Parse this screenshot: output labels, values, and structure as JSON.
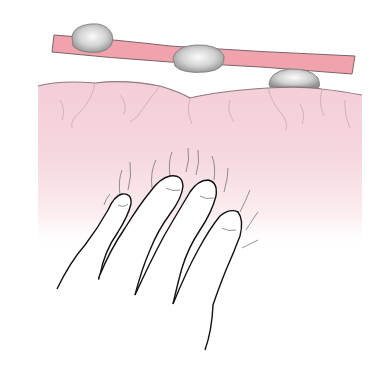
{
  "figure": {
    "description": "Illustration of fingertips palpating soft tissue beneath which a vessel with nodules lies",
    "colors": {
      "background": "#ffffff",
      "tissue": "#f4cfd8",
      "tissue_line": "#9a8088",
      "vessel": "#f0a0ab",
      "vessel_line": "#7a6468",
      "nodule_light": "#f4f4f4",
      "nodule_dark": "#9a9a9a",
      "outline": "#111111"
    },
    "elements": {
      "vessel": "vessel",
      "nodules": [
        "nodule-1",
        "nodule-2",
        "nodule-3"
      ],
      "tissue": "tissue",
      "fingers": [
        "little-finger",
        "ring-finger",
        "middle-finger",
        "index-finger"
      ]
    }
  }
}
